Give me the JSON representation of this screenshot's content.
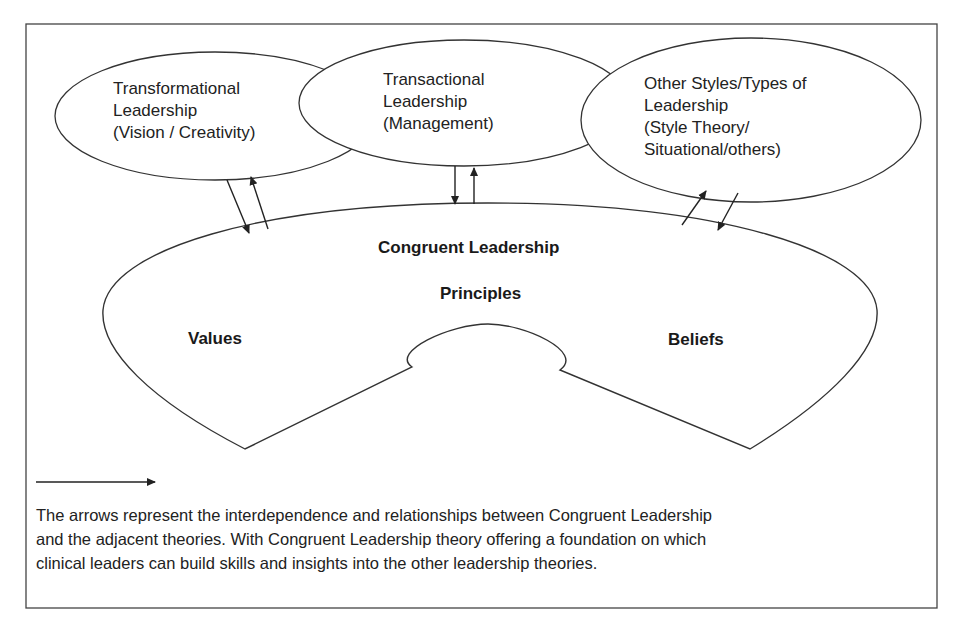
{
  "figure": {
    "top_nodes": [
      {
        "id": "transformational",
        "lines": [
          "Transformational",
          "Leadership",
          "(Vision / Creativity)"
        ]
      },
      {
        "id": "transactional",
        "lines": [
          "Transactional",
          "Leadership",
          "(Management)"
        ]
      },
      {
        "id": "other",
        "lines": [
          "Other Styles/Types of",
          "Leadership",
          "(Style Theory/",
          "Situational/others)"
        ]
      }
    ],
    "center": {
      "title": "Congruent Leadership",
      "principles": "Principles",
      "values": "Values",
      "beliefs": "Beliefs"
    },
    "legend": {
      "icon": "arrow-right-icon",
      "caption_lines": [
        "The arrows represent the interdependence and relationships between Congruent Leadership",
        "and the adjacent theories. With Congruent Leadership theory offering a foundation on which",
        "clinical leaders can build skills and insights into the other leadership theories."
      ]
    },
    "colors": {
      "stroke": "#333333",
      "background": "#ffffff",
      "text": "#1a1a1a"
    }
  }
}
